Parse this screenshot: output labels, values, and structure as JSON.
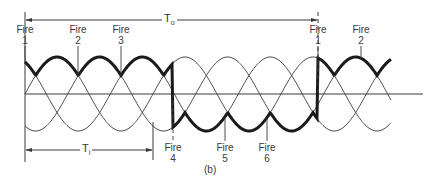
{
  "figure": {
    "caption": "(b)",
    "colors": {
      "line": "#3a3a3a",
      "thick": "#1a1a1a",
      "background": "#ffffff"
    }
  },
  "periods": {
    "output": {
      "symbol": "T",
      "subscript": "o"
    },
    "input": {
      "symbol": "T",
      "subscript": "i"
    }
  },
  "fire_labels": [
    {
      "word": "Fire",
      "num": "1",
      "x": 25,
      "pos": "top"
    },
    {
      "word": "Fire",
      "num": "2",
      "x": 78,
      "pos": "top"
    },
    {
      "word": "Fire",
      "num": "3",
      "x": 121,
      "pos": "top"
    },
    {
      "word": "Fire",
      "num": "4",
      "x": 173,
      "pos": "bottom"
    },
    {
      "word": "Fire",
      "num": "5",
      "x": 225,
      "pos": "bottom"
    },
    {
      "word": "Fire",
      "num": "6",
      "x": 267,
      "pos": "bottom"
    },
    {
      "word": "Fire",
      "num": "1",
      "x": 318,
      "pos": "top"
    },
    {
      "word": "Fire",
      "num": "2",
      "x": 361,
      "pos": "top"
    }
  ],
  "geometry": {
    "x0": 25,
    "baseline_y": 94,
    "amplitude": 37,
    "input_period_px": 128,
    "phases": 3,
    "wave_end_x": 391,
    "axis_end_x": 423,
    "output_start": 25,
    "output_switch_down": 173,
    "output_switch_up": 318,
    "to_arrow_y": 20,
    "to_arrow_end_x": 318,
    "ti_arrow_y": 150,
    "ti_arrow_end_x": 153
  }
}
